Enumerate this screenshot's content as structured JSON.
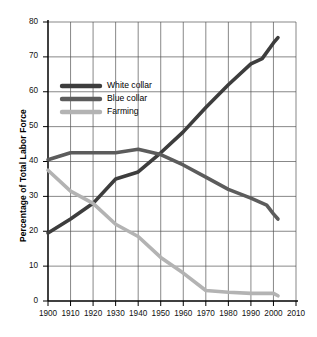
{
  "chart_data": {
    "type": "line",
    "title": "",
    "xlabel": "",
    "ylabel": "Percentage of Total Labor Force",
    "xlim": [
      1900,
      2010
    ],
    "ylim": [
      0,
      80
    ],
    "grid": true,
    "legend_position": "upper-left-inside",
    "x_ticks": [
      "1900",
      "1910",
      "1920",
      "1930",
      "1940",
      "1950",
      "1960",
      "1970",
      "1980",
      "1990",
      "2000",
      "2010"
    ],
    "y_ticks": [
      "0",
      "10",
      "20",
      "30",
      "40",
      "50",
      "60",
      "70",
      "80"
    ],
    "series": [
      {
        "name": "White collar",
        "color": "#3d3d3d",
        "x": [
          1900,
          1910,
          1920,
          1930,
          1940,
          1950,
          1960,
          1970,
          1980,
          1990,
          1995,
          2000,
          2002
        ],
        "values": [
          19.5,
          23.5,
          28.0,
          35.0,
          37.0,
          42.5,
          48.5,
          55.5,
          62.0,
          68.0,
          69.5,
          74.0,
          75.5
        ]
      },
      {
        "name": "Blue collar",
        "color": "#5c5c5c",
        "x": [
          1900,
          1910,
          1920,
          1930,
          1940,
          1950,
          1960,
          1970,
          1980,
          1990,
          1997,
          2000,
          2002
        ],
        "values": [
          40.5,
          42.5,
          42.5,
          42.5,
          43.5,
          42.0,
          39.0,
          35.5,
          32.0,
          29.5,
          27.5,
          25.0,
          23.5
        ]
      },
      {
        "name": "Farming",
        "color": "#b3b3b3",
        "x": [
          1900,
          1910,
          1920,
          1930,
          1940,
          1950,
          1960,
          1970,
          1980,
          1990,
          2000,
          2002
        ],
        "values": [
          37.5,
          31.5,
          28.0,
          22.0,
          18.5,
          12.5,
          8.0,
          3.0,
          2.5,
          2.2,
          2.2,
          1.5
        ]
      }
    ]
  },
  "legend": {
    "items": [
      {
        "label": "White collar",
        "color": "#3d3d3d"
      },
      {
        "label": "Blue collar",
        "color": "#5c5c5c"
      },
      {
        "label": "Farming",
        "color": "#b3b3b3"
      }
    ]
  },
  "axes": {
    "y_title": "Percentage of Total Labor Force"
  }
}
